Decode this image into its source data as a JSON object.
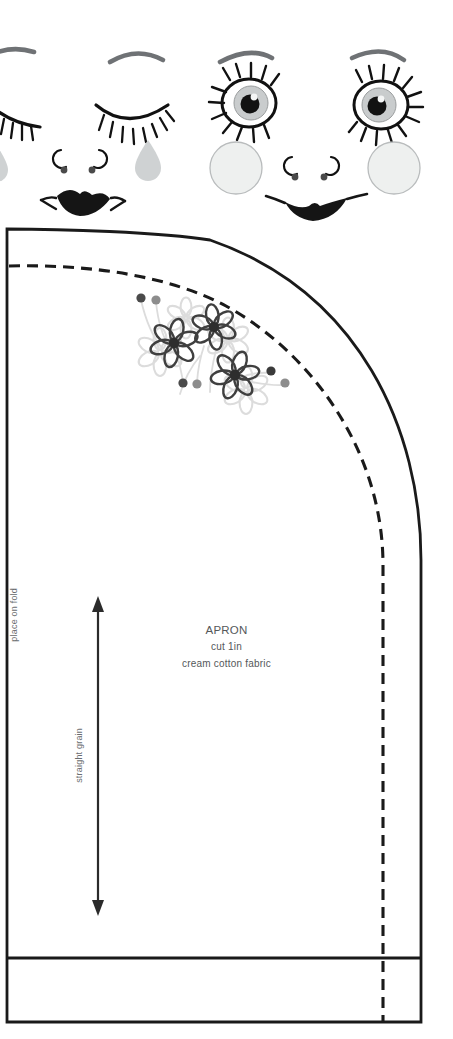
{
  "sheet": {
    "width": 453,
    "height": 1039,
    "background": "#ffffff"
  },
  "faces": {
    "title": "doll face embroidery transfers",
    "items": [
      {
        "name": "sleeping-face",
        "expression": "closed eyes with tear",
        "parts": [
          "eyebrow-left",
          "eyebrow-right",
          "closed-eye-left",
          "closed-eye-right",
          "eyelashes",
          "teardrop",
          "nose-curls",
          "nose-dots",
          "lips-pouty"
        ]
      },
      {
        "name": "awake-face",
        "expression": "open eyes smiling",
        "parts": [
          "eyebrow-left",
          "eyebrow-right",
          "open-eye-left",
          "open-eye-right",
          "iris",
          "pupil",
          "eyelashes",
          "cheek-circle-left",
          "cheek-circle-right",
          "nose-curls",
          "nose-dots",
          "lips-smiling"
        ]
      }
    ],
    "colors": {
      "ink": "#1a1a1a",
      "brow": "#6f7275",
      "iris": "#c9cccd",
      "cheek": "#eef0ef",
      "cheek_outline": "#b9bcbd",
      "tear": "#cfd2d3"
    }
  },
  "pattern": {
    "piece_name": "APRON",
    "cut_instruction": "cut 1in",
    "fabric": "cream cotton fabric",
    "fold_label": "place on fold",
    "grain_label": "straight grain",
    "lines": {
      "cutting_line_style": "solid",
      "seam_line_style": "dashed",
      "ink": "#1a1a1a",
      "cutting_line_width": 2.6,
      "seam_line_width": 3.0,
      "seam_dash": "11 7"
    },
    "geometry": {
      "left_edge_x": 7,
      "top_edge_y": 229,
      "right_edge_x": 421,
      "bottom_edge_y": 1022,
      "hem_line_y": 958,
      "seam_top_y": 265,
      "seam_right_x": 383
    },
    "grain_arrow": {
      "x": 98,
      "y_top": 598,
      "y_bottom": 915,
      "double_headed": true
    }
  },
  "embroidery": {
    "motif": "daisy spray",
    "colors": {
      "dark": "#3f3f3f",
      "mid": "#8d8d8d",
      "light": "#d4d4d4",
      "pale": "#e2e2e2"
    },
    "flowers": [
      {
        "cx": 174,
        "cy": 343,
        "r": 20,
        "shade": "dark"
      },
      {
        "cx": 214,
        "cy": 327,
        "r": 18,
        "shade": "dark"
      },
      {
        "cx": 235,
        "cy": 375,
        "r": 20,
        "shade": "dark"
      },
      {
        "cx": 160,
        "cy": 352,
        "r": 22,
        "shade": "light"
      },
      {
        "cx": 226,
        "cy": 340,
        "r": 20,
        "shade": "light"
      },
      {
        "cx": 243,
        "cy": 388,
        "r": 22,
        "shade": "light"
      }
    ],
    "dots": [
      {
        "cx": 141,
        "cy": 298,
        "r": 4.5,
        "shade": "dark"
      },
      {
        "cx": 156,
        "cy": 300,
        "r": 4.5,
        "shade": "mid"
      },
      {
        "cx": 183,
        "cy": 383,
        "r": 4.5,
        "shade": "dark"
      },
      {
        "cx": 197,
        "cy": 384,
        "r": 4.5,
        "shade": "mid"
      },
      {
        "cx": 271,
        "cy": 371,
        "r": 4.5,
        "shade": "dark"
      },
      {
        "cx": 285,
        "cy": 383,
        "r": 4.5,
        "shade": "mid"
      }
    ]
  }
}
